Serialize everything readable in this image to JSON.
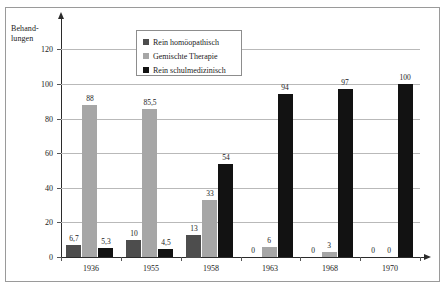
{
  "chart_data": {
    "type": "bar",
    "title": "",
    "xlabel": "",
    "ylabel": "Behand-\nlungen",
    "ylabel_line1": "Behand-",
    "ylabel_line2": "lungen",
    "ylim": [
      0,
      130
    ],
    "yticks": [
      0,
      20,
      40,
      60,
      80,
      100,
      120
    ],
    "grid": true,
    "legend_position": "top-center",
    "categories": [
      "1936",
      "1955",
      "1958",
      "1963",
      "1968",
      "1970"
    ],
    "series": [
      {
        "name": "Rein homöopathisch",
        "color": "#4d4d4d",
        "values": [
          6.7,
          10,
          13,
          0,
          0,
          0
        ],
        "labels": [
          "6,7",
          "10",
          "13",
          "0",
          "0",
          "0"
        ]
      },
      {
        "name": "Gemischte Therapie",
        "color": "#a6a6a6",
        "values": [
          88,
          85.5,
          33,
          6,
          3,
          0
        ],
        "labels": [
          "88",
          "85,5",
          "33",
          "6",
          "3",
          "0"
        ]
      },
      {
        "name": "Rein schulmedizinisch",
        "color": "#121212",
        "values": [
          5.3,
          4.5,
          54,
          94,
          97,
          100
        ],
        "labels": [
          "5,3",
          "4,5",
          "54",
          "94",
          "97",
          "100"
        ]
      }
    ]
  },
  "axis": {
    "tick_labels": [
      "0",
      "20",
      "40",
      "60",
      "80",
      "100",
      "120"
    ]
  },
  "legend": {
    "items": [
      {
        "label": "Rein homöopathisch"
      },
      {
        "label": "Gemischte Therapie"
      },
      {
        "label": "Rein schulmedizinisch"
      }
    ]
  }
}
